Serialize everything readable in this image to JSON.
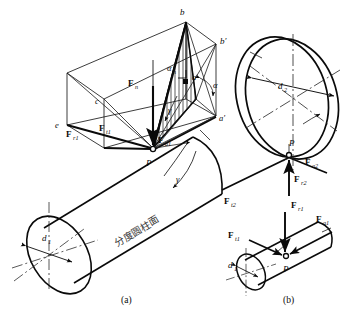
{
  "figure": {
    "title_text": "",
    "colors": {
      "ink": "#0a0a0a",
      "thin": "#1a1a1a",
      "hatch": "#2a2a2a",
      "center_line": "#222222",
      "background": "#ffffff"
    },
    "captions": [
      {
        "key": "a",
        "label": "(a)"
      },
      {
        "key": "b",
        "label": "(b)"
      }
    ],
    "panel_a": {
      "name": "helical-gear-force-decomposition",
      "surface_label": "分度圆柱面",
      "point_labels": [
        {
          "id": "b",
          "label": "b"
        },
        {
          "id": "bp",
          "label": "b′"
        },
        {
          "id": "a",
          "label": "a"
        },
        {
          "id": "ap",
          "label": "a′"
        },
        {
          "id": "c",
          "label": "c"
        },
        {
          "id": "e",
          "label": "e"
        },
        {
          "id": "P",
          "label": "P"
        }
      ],
      "force_labels": [
        {
          "id": "Fn",
          "base": "F",
          "sub": "n"
        },
        {
          "id": "Ft1",
          "base": "F",
          "sub": "t1"
        },
        {
          "id": "Fr1",
          "base": "F",
          "sub": "r1"
        },
        {
          "id": "Fa1",
          "base": "F",
          "sub": "a1"
        }
      ],
      "angle_labels": [
        {
          "id": "alpha_n",
          "label": "α",
          "sub": "n"
        },
        {
          "id": "alpha",
          "label": "α",
          "sub": ""
        },
        {
          "id": "gamma_1",
          "label": "γ",
          "sub": ""
        },
        {
          "id": "gamma_2",
          "label": "γ",
          "sub": ""
        }
      ],
      "diameter_label": {
        "base": "d",
        "sub": "1"
      }
    },
    "panel_b": {
      "name": "gear-pair-force-directions",
      "point_labels": [
        {
          "id": "P_top",
          "label": "P"
        },
        {
          "id": "P_bottom",
          "label": "P"
        }
      ],
      "force_labels": [
        {
          "id": "Fa2",
          "base": "F",
          "sub": "a2"
        },
        {
          "id": "Fr2",
          "base": "F",
          "sub": "r2"
        },
        {
          "id": "Ft2",
          "base": "F",
          "sub": "t2"
        },
        {
          "id": "Fr1",
          "base": "F",
          "sub": "r1"
        },
        {
          "id": "Ft1",
          "base": "F",
          "sub": "t1"
        },
        {
          "id": "Fa1",
          "base": "F",
          "sub": "a1"
        }
      ],
      "diameter_labels": [
        {
          "id": "d2",
          "base": "d",
          "sub": "2"
        },
        {
          "id": "d1",
          "base": "d",
          "sub": "1"
        }
      ]
    }
  }
}
